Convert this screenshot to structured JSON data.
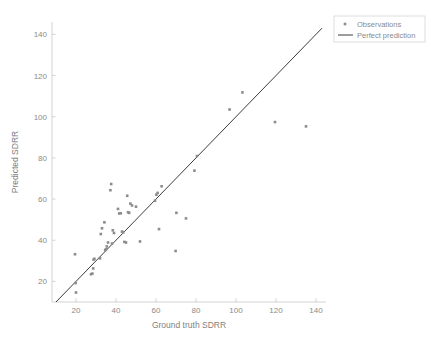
{
  "chart_data": {
    "type": "scatter",
    "title": "",
    "xlabel": "Ground truth SDRR",
    "ylabel": "Predicted SDRR",
    "xlim": [
      8,
      145
    ],
    "ylim": [
      10,
      146
    ],
    "xticks": [
      20,
      40,
      60,
      80,
      100,
      120,
      140
    ],
    "yticks": [
      20,
      40,
      60,
      80,
      100,
      120,
      140
    ],
    "grid": false,
    "legend_position": "top-right",
    "series": [
      {
        "name": "Observations",
        "type": "scatter",
        "marker": "square",
        "color": "#8c8c8c",
        "points": [
          [
            19.5,
            33.2
          ],
          [
            19.8,
            19.2
          ],
          [
            20.0,
            14.6
          ],
          [
            27.5,
            23.5
          ],
          [
            28.2,
            23.8
          ],
          [
            28.6,
            26.3
          ],
          [
            28.8,
            30.6
          ],
          [
            29.2,
            31.0
          ],
          [
            32.0,
            31.2
          ],
          [
            32.4,
            43.0
          ],
          [
            33.0,
            45.8
          ],
          [
            34.2,
            48.7
          ],
          [
            34.6,
            35.2
          ],
          [
            35.0,
            35.6
          ],
          [
            35.4,
            37.0
          ],
          [
            36.0,
            38.9
          ],
          [
            37.2,
            64.3
          ],
          [
            37.6,
            67.3
          ],
          [
            38.0,
            38.4
          ],
          [
            38.4,
            44.8
          ],
          [
            39.0,
            43.5
          ],
          [
            41.0,
            55.2
          ],
          [
            41.6,
            53.0
          ],
          [
            42.4,
            53.1
          ],
          [
            43.0,
            44.2
          ],
          [
            43.6,
            43.8
          ],
          [
            44.2,
            39.2
          ],
          [
            45.0,
            38.9
          ],
          [
            45.6,
            61.6
          ],
          [
            46.0,
            53.6
          ],
          [
            46.6,
            53.3
          ],
          [
            47.2,
            57.8
          ],
          [
            48.0,
            56.9
          ],
          [
            50.0,
            56.3
          ],
          [
            52.0,
            39.4
          ],
          [
            59.5,
            59.2
          ],
          [
            60.2,
            62.1
          ],
          [
            60.8,
            63.0
          ],
          [
            61.5,
            45.4
          ],
          [
            62.8,
            66.2
          ],
          [
            69.8,
            34.8
          ],
          [
            70.2,
            53.3
          ],
          [
            75.0,
            50.6
          ],
          [
            79.2,
            73.8
          ],
          [
            80.5,
            80.9
          ],
          [
            96.8,
            103.5
          ],
          [
            103.2,
            111.8
          ],
          [
            119.5,
            97.4
          ],
          [
            135.0,
            95.3
          ]
        ]
      },
      {
        "name": "Perfect prediction",
        "type": "line",
        "color": "#3c3c3c",
        "points": [
          [
            10,
            10
          ],
          [
            143,
            143
          ]
        ]
      }
    ]
  },
  "legend": {
    "items": [
      {
        "label": "Observations",
        "marker": "square",
        "color": "#8c8c8c"
      },
      {
        "label": "Perfect prediction",
        "marker": "line",
        "color": "#3c3c3c"
      }
    ]
  },
  "axes": {
    "x": {
      "label": "Ground truth SDRR",
      "ticks": [
        "20",
        "40",
        "60",
        "80",
        "100",
        "120",
        "140"
      ]
    },
    "y": {
      "label": "Predicted SDRR",
      "ticks": [
        "20",
        "40",
        "60",
        "80",
        "100",
        "120",
        "140"
      ]
    }
  }
}
